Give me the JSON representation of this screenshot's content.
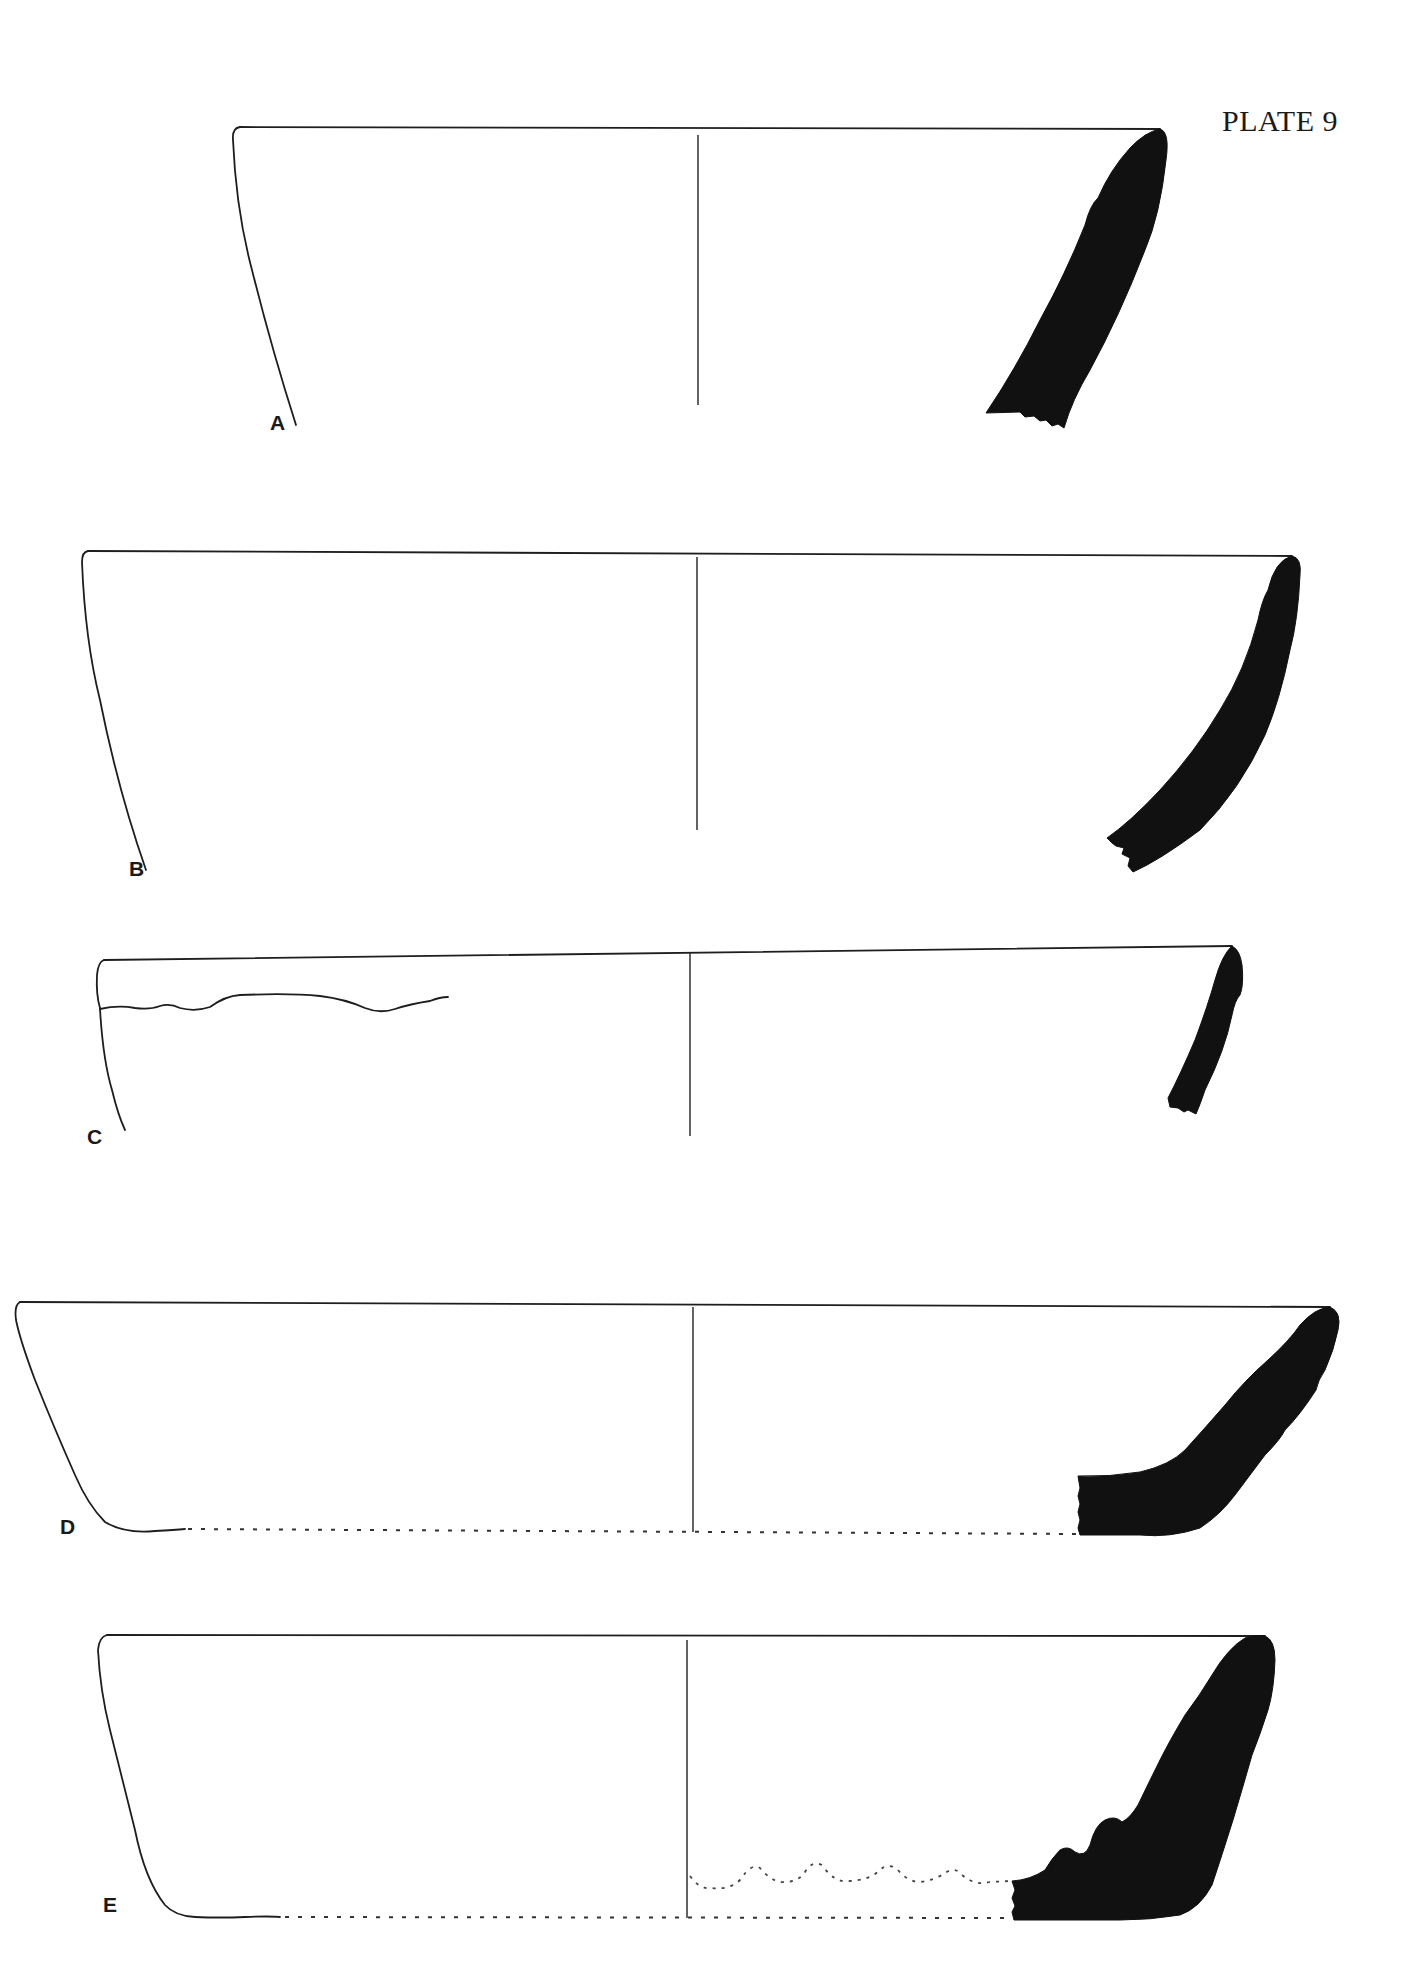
{
  "plate": {
    "title": "PLATE 9"
  },
  "figures": [
    {
      "id": "A",
      "label": "A",
      "description": "Bowl rim and body profile with solid black section on right"
    },
    {
      "id": "B",
      "label": "B",
      "description": "Bowl rim and body profile with solid black section on right"
    },
    {
      "id": "C",
      "label": "C",
      "description": "Bowl rim profile with wavy rim-band line on left and short black section on right"
    },
    {
      "id": "D",
      "label": "D",
      "description": "Shallow bowl profile with dotted base line and black section including base"
    },
    {
      "id": "E",
      "label": "E",
      "description": "Flat-bottomed bowl profile with dotted base, dotted wavy interior ridge line and ribbed black section"
    }
  ],
  "colors": {
    "background": "#ffffff",
    "ink": "#111111"
  }
}
